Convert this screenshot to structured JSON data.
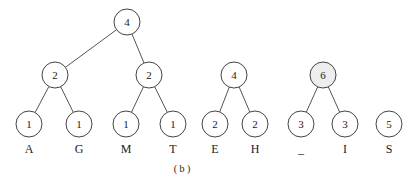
{
  "diagram": {
    "caption": "( b )",
    "highlight_color": "#eeeeee",
    "trees": [
      {
        "id": "tree1",
        "nodes": [
          {
            "id": "t1-root",
            "value": "4"
          },
          {
            "id": "t1-l",
            "value": "2",
            "parent": "t1-root"
          },
          {
            "id": "t1-r",
            "value": "2",
            "parent": "t1-root"
          },
          {
            "id": "t1-a",
            "value": "1",
            "label": "A",
            "parent": "t1-l"
          },
          {
            "id": "t1-g",
            "value": "1",
            "label": "G",
            "parent": "t1-l"
          },
          {
            "id": "t1-m",
            "value": "1",
            "label": "M",
            "parent": "t1-r"
          },
          {
            "id": "t1-t",
            "value": "1",
            "label": "T",
            "parent": "t1-r"
          }
        ]
      },
      {
        "id": "tree2",
        "nodes": [
          {
            "id": "t2-root",
            "value": "4"
          },
          {
            "id": "t2-e",
            "value": "2",
            "label": "E",
            "parent": "t2-root"
          },
          {
            "id": "t2-h",
            "value": "2",
            "label": "H",
            "parent": "t2-root"
          }
        ]
      },
      {
        "id": "tree3",
        "highlighted_root": true,
        "nodes": [
          {
            "id": "t3-root",
            "value": "6",
            "highlight": true
          },
          {
            "id": "t3-sp",
            "value": "3",
            "label": "_",
            "parent": "t3-root"
          },
          {
            "id": "t3-i",
            "value": "3",
            "label": "I",
            "parent": "t3-root"
          }
        ]
      },
      {
        "id": "tree4",
        "nodes": [
          {
            "id": "t4-s",
            "value": "5",
            "label": "S"
          }
        ]
      }
    ]
  }
}
